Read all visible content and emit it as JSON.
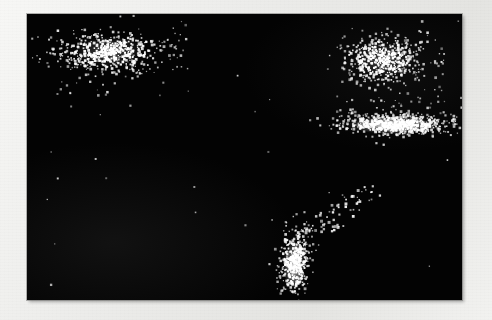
{
  "figure": {
    "kind": "scatter-with-cluster-ellipses",
    "background_color": "#030303",
    "margin_color": "#ececea",
    "point_color": "#ffffff",
    "ellipse_stroke_color": "#e8e8e8"
  },
  "chart_data": {
    "type": "scatter",
    "title": "",
    "subtitle": "",
    "xlabel": "",
    "ylabel": "",
    "grid": false,
    "legend": "none",
    "axes_visible": false,
    "tick_labels_x": [],
    "tick_labels_y": [],
    "xlim": [
      0,
      435
    ],
    "ylim": [
      0,
      286
    ],
    "plot_area_px": {
      "x": 27,
      "y": 14,
      "width": 435,
      "height": 286
    },
    "series": [
      {
        "name": "cluster-1-top-left",
        "n_points": 520,
        "center": [
          82,
          39
        ],
        "radii": [
          59,
          23
        ],
        "rotation_deg": 0,
        "density": "medium",
        "core_brightness": "moderate",
        "ellipse": {
          "cx": 82,
          "cy": 39,
          "rx": 59,
          "ry": 23,
          "rotation_deg": 0
        }
      },
      {
        "name": "cluster-2-top-right",
        "n_points": 470,
        "center": [
          356,
          46
        ],
        "radii": [
          45,
          26
        ],
        "rotation_deg": 0,
        "density": "medium",
        "core_brightness": "moderate",
        "ellipse": {
          "cx": 356,
          "cy": 46,
          "rx": 45,
          "ry": 26,
          "rotation_deg": 0
        }
      },
      {
        "name": "cluster-3-mid-right-flat",
        "n_points": 600,
        "center": [
          369,
          111
        ],
        "radii": [
          64,
          12
        ],
        "rotation_deg": 0,
        "density": "high",
        "core_brightness": "saturated",
        "ellipse": {
          "cx": 369,
          "cy": 111,
          "rx": 64,
          "ry": 12,
          "rotation_deg": 0
        }
      },
      {
        "name": "cluster-4-bottom-center-vertical",
        "n_points": 400,
        "center": [
          268,
          248
        ],
        "radii": [
          17,
          37
        ],
        "rotation_deg": 0,
        "density": "high",
        "core_brightness": "bright",
        "ellipse": {
          "cx": 268,
          "cy": 248,
          "rx": 17,
          "ry": 37,
          "rotation_deg": 0
        }
      }
    ],
    "outlier_groups": [
      {
        "name": "diagonal-spray-above-cluster-4",
        "n_points": 70,
        "from": [
          278,
          225
        ],
        "to": [
          345,
          175
        ],
        "spread": 16
      },
      {
        "name": "sparse-noise-between-right-clusters",
        "n_points": 55,
        "region": [
          310,
          75,
          130,
          35
        ]
      },
      {
        "name": "halo-noise-cluster-1",
        "n_points": 60,
        "region": [
          20,
          8,
          145,
          75
        ]
      },
      {
        "name": "halo-noise-cluster-2",
        "n_points": 50,
        "region": [
          300,
          14,
          120,
          70
        ]
      },
      {
        "name": "sparse-field-noise",
        "n_points": 30,
        "region": [
          0,
          0,
          435,
          286
        ]
      }
    ]
  }
}
